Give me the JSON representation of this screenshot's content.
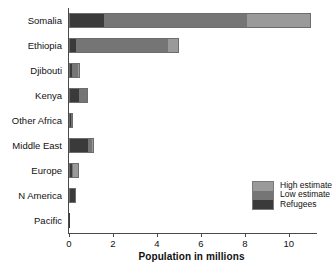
{
  "chart_data": {
    "type": "bar",
    "orientation": "horizontal",
    "stacked": true,
    "title": "",
    "xlabel": "Population in millions",
    "ylabel": "",
    "xlim": [
      0,
      11.1
    ],
    "xticks": [
      0,
      2,
      4,
      6,
      8,
      10
    ],
    "xtick_labels": [
      "0",
      "2",
      "4",
      "6",
      "8",
      "10"
    ],
    "grid": false,
    "legend_position": "inside-lower-right",
    "categories": [
      "Somalia",
      "Ethiopia",
      "Djibouti",
      "Kenya",
      "Other Africa",
      "Middle East",
      "Europe",
      "N America",
      "Pacific"
    ],
    "series": [
      {
        "name": "Refugees",
        "color": "#3a3a3a",
        "values": [
          1.6,
          0.3,
          0.15,
          0.45,
          0.1,
          0.85,
          0.15,
          0.3,
          0.02
        ]
      },
      {
        "name": "Low estimate",
        "color": "#757575",
        "values": [
          6.5,
          4.2,
          0.25,
          0.35,
          0.1,
          0.2,
          0.05,
          0.0,
          0.0
        ]
      },
      {
        "name": "High estimate",
        "color": "#9a9a9a",
        "values": [
          2.9,
          0.5,
          0.1,
          0.05,
          0.0,
          0.1,
          0.25,
          0.0,
          0.0
        ]
      }
    ],
    "totals": [
      11.0,
      5.0,
      0.5,
      0.85,
      0.2,
      1.15,
      0.45,
      0.3,
      0.02
    ],
    "legend": [
      {
        "label": "High estimate",
        "color": "#9a9a9a"
      },
      {
        "label": "Low estimate",
        "color": "#757575"
      },
      {
        "label": "Refugees",
        "color": "#3a3a3a"
      }
    ]
  }
}
